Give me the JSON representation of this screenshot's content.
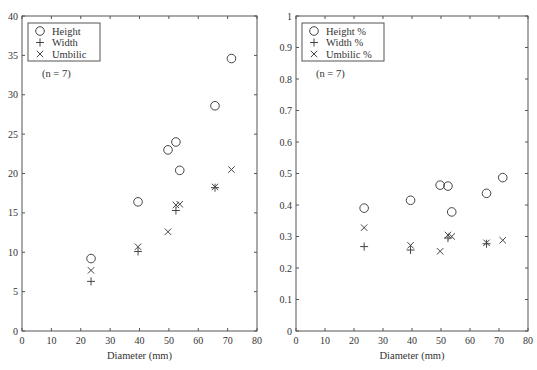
{
  "chart_data": [
    {
      "type": "scatter",
      "title": "",
      "xlabel": "Diameter (mm)",
      "ylabel": "",
      "xlim": [
        0,
        80
      ],
      "ylim": [
        0,
        40
      ],
      "xticks": [
        0,
        10,
        20,
        30,
        40,
        50,
        60,
        70,
        80
      ],
      "yticks": [
        0,
        5,
        10,
        15,
        20,
        25,
        30,
        35,
        40
      ],
      "grid": false,
      "legend_position": "upper-left",
      "annotation": "(n = 7)",
      "series": [
        {
          "name": "Height",
          "marker": "circle",
          "x": [
            23.5,
            39.5,
            49.7,
            52.4,
            53.7,
            65.7,
            71.3
          ],
          "y": [
            9.2,
            16.4,
            23.0,
            24.0,
            20.4,
            28.6,
            34.6
          ]
        },
        {
          "name": "Width",
          "marker": "plus",
          "x": [
            23.5,
            39.5,
            52.4,
            65.7
          ],
          "y": [
            6.3,
            10.1,
            15.3,
            18.2
          ]
        },
        {
          "name": "Umbilic",
          "marker": "cross",
          "x": [
            23.5,
            39.5,
            49.7,
            52.4,
            53.7,
            65.7,
            71.3
          ],
          "y": [
            7.7,
            10.7,
            12.6,
            16.0,
            16.1,
            18.3,
            20.5
          ]
        }
      ]
    },
    {
      "type": "scatter",
      "title": "",
      "xlabel": "Diameter (mm)",
      "ylabel": "",
      "xlim": [
        0,
        80
      ],
      "ylim": [
        0,
        1
      ],
      "xticks": [
        0,
        10,
        20,
        30,
        40,
        50,
        60,
        70,
        80
      ],
      "yticks": [
        0,
        0.1,
        0.2,
        0.3,
        0.4,
        0.5,
        0.6,
        0.7,
        0.8,
        0.9,
        1
      ],
      "grid": false,
      "legend_position": "upper-left",
      "annotation": "(n = 7)",
      "series": [
        {
          "name": "Height %",
          "marker": "circle",
          "x": [
            23.5,
            39.5,
            49.7,
            52.4,
            53.7,
            65.7,
            71.3
          ],
          "y": [
            0.39,
            0.415,
            0.463,
            0.46,
            0.378,
            0.437,
            0.487
          ]
        },
        {
          "name": "Width %",
          "marker": "plus",
          "x": [
            23.5,
            39.5,
            52.4,
            65.7
          ],
          "y": [
            0.268,
            0.257,
            0.295,
            0.277
          ]
        },
        {
          "name": "Umbilic %",
          "marker": "cross",
          "x": [
            23.5,
            39.5,
            49.7,
            52.4,
            53.7,
            65.7,
            71.3
          ],
          "y": [
            0.328,
            0.272,
            0.253,
            0.305,
            0.3,
            0.28,
            0.288
          ]
        }
      ]
    }
  ],
  "charts": [
    {
      "xlabel": "Diameter (mm)",
      "annotation": "(n = 7)",
      "legend": [
        "Height",
        "Width",
        "Umbilic"
      ]
    },
    {
      "xlabel": "Diameter (mm)",
      "annotation": "(n = 7)",
      "legend": [
        "Height %",
        "Width %",
        "Umbilic %"
      ]
    }
  ]
}
